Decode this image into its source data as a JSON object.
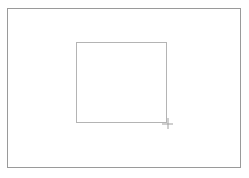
{
  "app": {
    "title": "Drawing Canvas",
    "background_color": "#ffffff"
  },
  "canvas": {
    "name": "canvas-frame",
    "border_color": "#9a9a9a",
    "fill_color": "#ffffff",
    "x": 7,
    "y": 8,
    "width": 234,
    "height": 160,
    "border_width": 1
  },
  "shapes": [
    {
      "name": "drawn-rectangle",
      "type": "rectangle",
      "border_color": "#b4b4b4",
      "fill_color": "transparent",
      "x": 76,
      "y": 42,
      "width": 91,
      "height": 81,
      "border_width": 1
    }
  ],
  "cursor": {
    "name": "crosshair-cursor",
    "type": "crosshair",
    "color": "#a0a0a0",
    "x": 167,
    "y": 123,
    "size": 11
  }
}
